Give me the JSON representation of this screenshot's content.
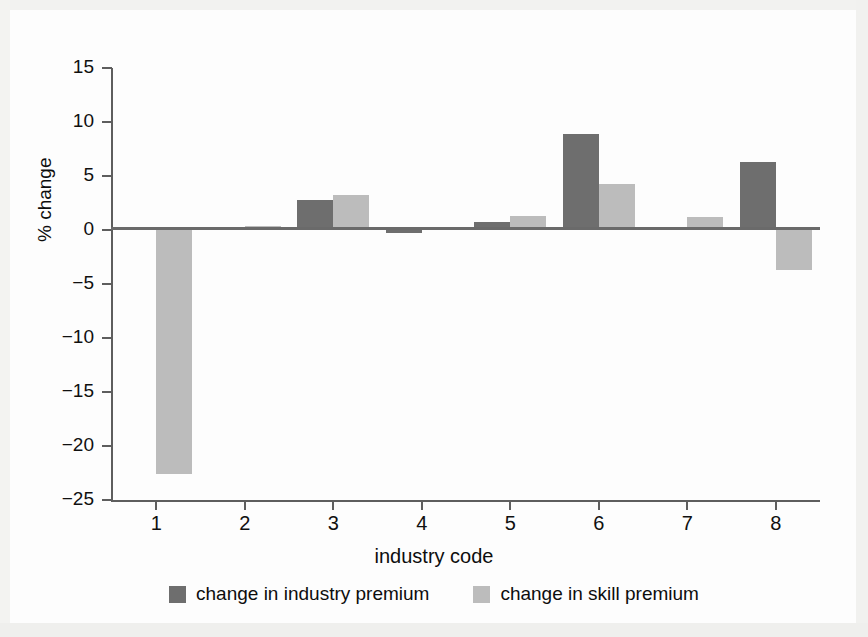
{
  "chart_data": {
    "type": "bar",
    "title": "",
    "subtitle": "",
    "xlabel": "industry code",
    "ylabel": "% change",
    "categories": [
      "1",
      "2",
      "3",
      "4",
      "5",
      "6",
      "7",
      "8"
    ],
    "series": [
      {
        "name": "change in industry premium",
        "color": "#6e6e6e",
        "values": [
          0.0,
          0.0,
          2.8,
          -0.3,
          0.7,
          8.9,
          0.15,
          6.3
        ]
      },
      {
        "name": "change in skill premium",
        "color": "#bcbcbc",
        "values": [
          -22.6,
          0.4,
          3.2,
          0.0,
          1.3,
          4.3,
          1.2,
          -3.7
        ]
      }
    ],
    "ylim": [
      -25,
      15
    ],
    "yticks": [
      15,
      10,
      5,
      0,
      -5,
      -10,
      -15,
      -20,
      -25
    ],
    "ytick_labels": [
      "15",
      "10",
      "5",
      "0",
      "−5",
      "−10",
      "−15",
      "−20",
      "−25"
    ],
    "grid": false,
    "legend_position": "bottom",
    "zero_line": true
  },
  "legend": {
    "items": [
      {
        "label": "change in industry premium",
        "color": "#6e6e6e",
        "swatch": "legend-swatch-industry"
      },
      {
        "label": "change in skill premium",
        "color": "#bcbcbc",
        "swatch": "legend-swatch-skill"
      }
    ]
  },
  "colors": {
    "industry_premium": "#6e6e6e",
    "skill_premium": "#bcbcbc",
    "axis": "#5e5e5e",
    "text": "#0d0d0d",
    "background": "#fdfdfd"
  }
}
